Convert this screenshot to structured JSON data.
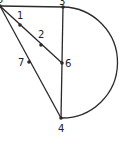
{
  "diagram": {
    "stroke_color": "#2a2a2a",
    "points": [
      {
        "id": "5",
        "label": "5",
        "x": 0,
        "y": 6,
        "lx": -3,
        "ly": 3
      },
      {
        "id": "3",
        "label": "3",
        "x": 63,
        "y": 7,
        "lx": 59,
        "ly": 5
      },
      {
        "id": "1",
        "label": "1",
        "x": 20,
        "y": 25,
        "lx": 17,
        "ly": 19
      },
      {
        "id": "2",
        "label": "2",
        "x": 41,
        "y": 45,
        "lx": 38,
        "ly": 38
      },
      {
        "id": "6",
        "label": "6",
        "x": 62,
        "y": 63,
        "lx": 65,
        "ly": 67
      },
      {
        "id": "7",
        "label": "7",
        "x": 29,
        "y": 62,
        "lx": 18,
        "ly": 66
      },
      {
        "id": "4",
        "label": "4",
        "x": 61,
        "y": 118,
        "lx": 58,
        "ly": 132
      }
    ],
    "segments": [
      {
        "from": "5",
        "to": "3"
      },
      {
        "from": "5",
        "to": "6"
      },
      {
        "from": "5",
        "to": "4"
      },
      {
        "from": "3",
        "to": "4"
      }
    ],
    "arc": {
      "from": "3",
      "to": "4",
      "radius": 55.5,
      "side": "right"
    }
  }
}
